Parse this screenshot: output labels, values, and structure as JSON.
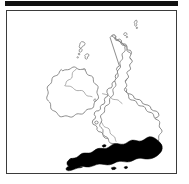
{
  "figure": {
    "kind": "map-thumbnail",
    "subject": "British Isles",
    "caption": "",
    "title": "",
    "frame_border_color": "#3b3b3b",
    "background_color": "#ffffff",
    "top_rule_color": "#111111"
  },
  "map": {
    "coastline_color": "#6e6e6e",
    "internal_border_color": "#8a8a8a",
    "land_fill_color": "#ffffff",
    "highlight_fill_color": "#000000",
    "landmasses": [
      {
        "name": "great-britain",
        "label": "Great Britain"
      },
      {
        "name": "ireland",
        "label": "Ireland"
      },
      {
        "name": "outer-hebrides",
        "label": "Outer Hebrides"
      },
      {
        "name": "skye",
        "label": "Isle of Skye"
      },
      {
        "name": "mull",
        "label": "Mull"
      },
      {
        "name": "islay",
        "label": "Islay"
      },
      {
        "name": "orkney",
        "label": "Orkney Islands"
      },
      {
        "name": "shetland",
        "label": "Shetland Islands"
      },
      {
        "name": "anglesey",
        "label": "Anglesey"
      },
      {
        "name": "isle-of-man",
        "label": "Isle of Man"
      },
      {
        "name": "isle-of-wight",
        "label": "Isle of Wight"
      }
    ],
    "internal_borders": [
      {
        "name": "scotland-england-border",
        "label": "Scotland / England"
      },
      {
        "name": "wales-england-border",
        "label": "Wales / England"
      },
      {
        "name": "northern-ireland-border",
        "label": "Northern Ireland / Ireland"
      }
    ],
    "highlight": {
      "name": "southern-england",
      "label": "Southern England",
      "fill": "#000000",
      "description": "Solid shaded area covering south-west and south-east England"
    }
  },
  "accessibility": {
    "alt_text": "Outline map of the British Isles with southern England shaded solid black"
  }
}
